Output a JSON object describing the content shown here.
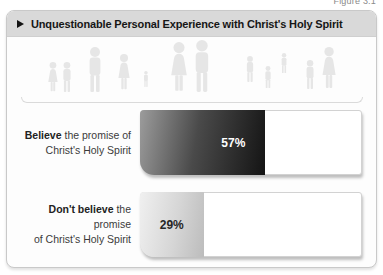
{
  "figure_caption": "Figure 3.1",
  "header": {
    "title": "Unquestionable Personal Experience with Christ's Holy Spirit"
  },
  "chart_data": {
    "type": "bar",
    "orientation": "horizontal",
    "title": "Unquestionable Personal Experience with Christ's Holy Spirit",
    "categories": [
      "Believe the promise of Christ's Holy Spirit",
      "Don't believe the promise of Christ's Holy Spirit"
    ],
    "values": [
      57,
      29
    ],
    "xlim": [
      0,
      100
    ],
    "value_label_position": "inside-end",
    "legend": "none",
    "grid": "off",
    "bars": [
      {
        "label_bold": "Believe",
        "label_after_bold": " the promise of",
        "label_line2": "Christ's Holy Spirit",
        "value": 57,
        "value_label": "57%",
        "fill_style": "dark-gradient",
        "value_text_color": "#ffffff"
      },
      {
        "label_bold": "Don't believe",
        "label_after_bold": " the promise",
        "label_line2": "of Christ's Holy Spirit",
        "value": 29,
        "value_label": "29%",
        "fill_style": "light-gradient",
        "value_text_color": "#262626"
      }
    ]
  },
  "decoration": {
    "colors": {
      "titlebar_bg": "#d9d9d9",
      "card_border": "#c9c9c9",
      "bar_dark_gradient_start": "#9c9c9c",
      "bar_dark_gradient_end": "#141414",
      "bar_light_gradient_start": "#f0f0f0",
      "bar_light_gradient_end": "#bcbcbc",
      "people_silhouette": "#e6e6e6"
    },
    "people": [
      {
        "type": "girl",
        "x": 32,
        "h": 30,
        "lift": 0
      },
      {
        "type": "boy",
        "x": 46,
        "h": 30,
        "lift": 0
      },
      {
        "type": "man",
        "x": 74,
        "h": 45,
        "lift": 0
      },
      {
        "type": "woman",
        "x": 103,
        "h": 36,
        "lift": 2
      },
      {
        "type": "child",
        "x": 125,
        "h": 16,
        "lift": 5
      },
      {
        "type": "woman",
        "x": 158,
        "h": 50,
        "lift": 0
      },
      {
        "type": "man",
        "x": 181,
        "h": 52,
        "lift": 0
      },
      {
        "type": "boy",
        "x": 229,
        "h": 26,
        "lift": 10
      },
      {
        "type": "boy",
        "x": 247,
        "h": 22,
        "lift": 4
      },
      {
        "type": "child",
        "x": 263,
        "h": 20,
        "lift": 19
      },
      {
        "type": "boy",
        "x": 289,
        "h": 29,
        "lift": 3
      },
      {
        "type": "woman",
        "x": 308,
        "h": 42,
        "lift": 3
      }
    ]
  }
}
